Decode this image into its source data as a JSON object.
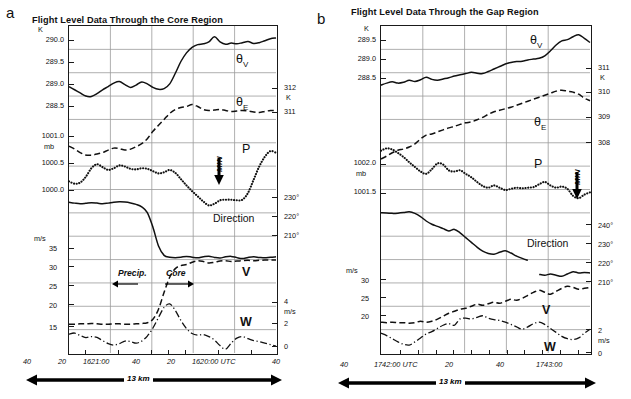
{
  "figure": {
    "panels": [
      {
        "letter": "a",
        "title": "Flight Level Data Through the Core Region",
        "left_axis": {
          "groups": [
            {
              "unit": "K",
              "labels": [
                "290.0",
                "289.5",
                "289.0",
                "288.5"
              ]
            },
            {
              "unit": "mb",
              "labels": [
                "1001.0",
                "1000.5",
                "1000.0"
              ]
            },
            {
              "unit": "m/s",
              "labels": [
                "35",
                "30",
                "25",
                "20",
                "15"
              ]
            }
          ]
        },
        "right_axis": {
          "groups": [
            {
              "unit": "K",
              "labels": [
                "312",
                "311"
              ]
            },
            {
              "unit": "",
              "labels": [
                "230°",
                "220°",
                "210°"
              ]
            },
            {
              "unit": "m/s",
              "labels": [
                "4",
                "2",
                "0"
              ]
            }
          ]
        },
        "x_ticks": [
          "40",
          "20",
          "1621:00",
          "40",
          "20",
          "1620:00 UTC",
          "40"
        ],
        "curve_labels": [
          {
            "name": "theta-v",
            "text": "θ",
            "sub": "V"
          },
          {
            "name": "theta-e",
            "text": "θ",
            "sub": "E"
          },
          {
            "name": "pressure",
            "text": "P",
            "sub": ""
          },
          {
            "name": "direction",
            "text": "Direction",
            "sub": ""
          },
          {
            "name": "wind-speed",
            "text": "V",
            "sub": ""
          },
          {
            "name": "vertical-velocity",
            "text": "W",
            "sub": ""
          }
        ],
        "annotations": [
          {
            "name": "min-marker",
            "text": "MIN"
          },
          {
            "name": "precip-label",
            "text": "Precip."
          },
          {
            "name": "core-label",
            "text": "Core"
          }
        ],
        "scale_bar": "13 km"
      },
      {
        "letter": "b",
        "title": "Flight Level Data Through the Gap Region",
        "left_axis": {
          "groups": [
            {
              "unit": "K",
              "labels": [
                "289.5",
                "289.0",
                "288.5"
              ]
            },
            {
              "unit": "mb",
              "labels": [
                "1002.0",
                "1001.5"
              ]
            },
            {
              "unit": "m/s",
              "labels": [
                "30",
                "25",
                "20"
              ]
            }
          ]
        },
        "right_axis": {
          "groups": [
            {
              "unit": "K",
              "labels": [
                "311",
                "310",
                "309",
                "308"
              ]
            },
            {
              "unit": "",
              "labels": [
                "240°",
                "230°",
                "220°",
                "210°"
              ]
            },
            {
              "unit": "m/s",
              "labels": [
                "2",
                "0"
              ]
            }
          ]
        },
        "x_ticks": [
          "40",
          "1742:00 UTC",
          "20",
          "40",
          "1743:00"
        ],
        "curve_labels": [
          {
            "name": "theta-v",
            "text": "θ",
            "sub": "V"
          },
          {
            "name": "theta-e",
            "text": "θ",
            "sub": "E"
          },
          {
            "name": "pressure",
            "text": "P",
            "sub": ""
          },
          {
            "name": "direction",
            "text": "Direction",
            "sub": ""
          },
          {
            "name": "wind-speed",
            "text": "V",
            "sub": ""
          },
          {
            "name": "vertical-velocity",
            "text": "W",
            "sub": ""
          }
        ],
        "annotations": [
          {
            "name": "min-marker",
            "text": "MIN"
          }
        ],
        "scale_bar": "13 km"
      }
    ]
  },
  "chart_data": [
    {
      "type": "line",
      "title": "Flight Level Data Through the Core Region",
      "panel": "a",
      "xlabel": "Time (UTC, decreasing to the right)",
      "grid": true,
      "legend": "inline-curve-labels",
      "x_tick_labels": [
        "40",
        "20",
        "1621:00",
        "40",
        "20",
        "1620:00 UTC",
        "40"
      ],
      "axes": [
        {
          "name": "theta_v",
          "side": "left",
          "unit": "K",
          "ticks": [
            290.0,
            289.5,
            289.0,
            288.5
          ]
        },
        {
          "name": "theta_e",
          "side": "right",
          "unit": "K",
          "ticks": [
            312,
            311
          ]
        },
        {
          "name": "P",
          "side": "left",
          "unit": "mb",
          "ticks": [
            1001.0,
            1000.5,
            1000.0
          ]
        },
        {
          "name": "Direction",
          "side": "right",
          "unit": "deg",
          "ticks": [
            230,
            220,
            210
          ]
        },
        {
          "name": "V",
          "side": "left",
          "unit": "m/s",
          "ticks": [
            35,
            30,
            25,
            20,
            15
          ]
        },
        {
          "name": "W",
          "side": "right",
          "unit": "m/s",
          "ticks": [
            4,
            2,
            0
          ]
        }
      ],
      "series": [
        {
          "name": "θv",
          "unit": "K",
          "style": "solid",
          "values": [
            288.88,
            288.8,
            288.72,
            288.64,
            288.63,
            288.7,
            288.8,
            288.88,
            288.97,
            289.01,
            288.93,
            288.86,
            288.92,
            289.0,
            288.95,
            288.86,
            288.81,
            288.83,
            288.95,
            289.22,
            289.52,
            289.74,
            289.88,
            289.95,
            289.97,
            290.02,
            290.15,
            290.02,
            289.96,
            289.99,
            289.97,
            290.0,
            290.03,
            289.98,
            290.0,
            290.05,
            290.1,
            290.12
          ]
        },
        {
          "name": "θE",
          "unit": "K",
          "style": "dashed",
          "values": [
            311.18,
            311.12,
            311.05,
            311.0,
            311.0,
            311.02,
            311.05,
            311.1,
            311.14,
            311.13,
            311.1,
            311.12,
            311.17,
            311.23,
            311.33,
            311.48,
            311.6,
            311.72,
            311.84,
            311.92,
            311.96,
            311.98,
            312.02,
            311.98,
            311.92,
            311.9,
            311.91,
            311.92,
            311.9,
            311.88,
            311.89,
            311.9,
            311.89,
            311.87,
            311.86,
            311.88,
            311.9,
            311.9
          ]
        },
        {
          "name": "P",
          "unit": "mb",
          "style": "dotted",
          "values": [
            1000.32,
            1000.28,
            1000.3,
            1000.4,
            1000.55,
            1000.62,
            1000.57,
            1000.52,
            1000.55,
            1000.6,
            1000.58,
            1000.54,
            1000.53,
            1000.55,
            1000.54,
            1000.5,
            1000.46,
            1000.48,
            1000.52,
            1000.47,
            1000.36,
            1000.25,
            1000.15,
            1000.06,
            999.97,
            999.9,
            999.93,
            999.99,
            1000.0,
            1000.0,
            999.99,
            1000.0,
            1000.12,
            1000.35,
            1000.58,
            1000.75,
            1000.85,
            1000.82
          ]
        },
        {
          "name": "Direction",
          "unit": "deg",
          "style": "solid",
          "values": [
            236.0,
            235.6,
            235.3,
            235.5,
            235.8,
            235.6,
            235.3,
            235.6,
            236.0,
            236.2,
            236.1,
            235.7,
            235.0,
            233.8,
            231.0,
            224.0,
            215.0,
            210.5,
            209.6,
            209.4,
            209.6,
            210.0,
            209.6,
            209.3,
            209.8,
            210.1,
            209.5,
            209.2,
            209.8,
            210.0,
            209.4,
            209.0,
            209.5,
            209.8,
            209.5,
            209.3,
            209.6,
            209.8
          ]
        },
        {
          "name": "V",
          "unit": "m/s",
          "style": "dashed",
          "values": [
            15.0,
            15.0,
            15.1,
            15.1,
            15.2,
            15.1,
            15.0,
            15.0,
            15.1,
            15.1,
            15.0,
            15.0,
            15.1,
            15.2,
            15.4,
            16.3,
            19.0,
            23.5,
            27.5,
            29.8,
            30.6,
            30.9,
            31.5,
            31.9,
            31.7,
            31.3,
            31.5,
            31.8,
            31.9,
            31.7,
            31.8,
            31.9,
            32.0,
            31.9,
            32.0,
            32.1,
            32.1,
            32.1
          ]
        },
        {
          "name": "W",
          "unit": "m/s",
          "style": "dashdot",
          "values": [
            0.95,
            1.05,
            0.8,
            0.6,
            0.7,
            0.62,
            0.3,
            0.0,
            -0.15,
            0.0,
            0.25,
            0.2,
            0.05,
            0.25,
            0.75,
            1.55,
            2.6,
            3.6,
            3.95,
            3.3,
            2.3,
            1.5,
            1.0,
            0.85,
            0.9,
            0.7,
            0.35,
            -0.2,
            -0.55,
            0.05,
            0.55,
            0.7,
            0.5,
            0.3,
            0.2,
            0.05,
            -0.1,
            -0.25
          ]
        }
      ]
    },
    {
      "type": "line",
      "title": "Flight Level Data Through the Gap Region",
      "panel": "b",
      "xlabel": "Time (UTC, decreasing to the right)",
      "grid": true,
      "legend": "inline-curve-labels",
      "x_tick_labels": [
        "40",
        "1742:00 UTC",
        "20",
        "40",
        "1743:00"
      ],
      "axes": [
        {
          "name": "theta_v",
          "side": "left",
          "unit": "K",
          "ticks": [
            289.5,
            289.0,
            288.5
          ]
        },
        {
          "name": "theta_e",
          "side": "right",
          "unit": "K",
          "ticks": [
            311,
            310,
            309,
            308
          ]
        },
        {
          "name": "P",
          "side": "left",
          "unit": "mb",
          "ticks": [
            1002.0,
            1001.5
          ]
        },
        {
          "name": "Direction",
          "side": "right",
          "unit": "deg",
          "ticks": [
            240,
            230,
            220,
            210
          ]
        },
        {
          "name": "V",
          "side": "left",
          "unit": "m/s",
          "ticks": [
            30,
            25,
            20
          ]
        },
        {
          "name": "W",
          "side": "right",
          "unit": "m/s",
          "ticks": [
            2,
            0
          ]
        }
      ],
      "series": [
        {
          "name": "θv",
          "unit": "K",
          "style": "solid",
          "values": [
            288.45,
            288.5,
            288.53,
            288.5,
            288.52,
            288.57,
            288.54,
            288.58,
            288.64,
            288.59,
            288.57,
            288.6,
            288.63,
            288.67,
            288.7,
            288.73,
            288.76,
            288.74,
            288.73,
            288.78,
            288.84,
            288.9,
            288.96,
            289.0,
            289.02,
            289.03,
            289.06,
            289.08,
            289.1,
            289.16,
            289.28,
            289.42,
            289.52,
            289.55,
            289.62,
            289.67,
            289.58,
            289.48
          ]
        },
        {
          "name": "θE",
          "unit": "K",
          "style": "dashed",
          "values": [
            307.6,
            307.72,
            307.85,
            307.95,
            308.0,
            308.08,
            308.2,
            308.4,
            308.55,
            308.6,
            308.68,
            308.76,
            308.84,
            308.9,
            308.98,
            309.04,
            309.08,
            309.16,
            309.26,
            309.38,
            309.48,
            309.54,
            309.6,
            309.66,
            309.74,
            309.82,
            309.9,
            309.98,
            310.06,
            310.14,
            310.22,
            310.3,
            310.34,
            310.3,
            310.26,
            310.18,
            310.02,
            309.92
          ]
        },
        {
          "name": "P",
          "unit": "mb",
          "style": "dotted",
          "values": [
            1002.16,
            1002.2,
            1002.18,
            1002.12,
            1002.05,
            1001.96,
            1001.88,
            1001.8,
            1001.76,
            1001.84,
            1001.94,
            1001.92,
            1001.82,
            1001.8,
            1001.82,
            1001.76,
            1001.7,
            1001.62,
            1001.55,
            1001.52,
            1001.56,
            1001.52,
            1001.48,
            1001.5,
            1001.52,
            1001.51,
            1001.52,
            1001.53,
            1001.58,
            1001.62,
            1001.56,
            1001.52,
            1001.54,
            1001.5,
            1001.38,
            1001.34,
            1001.4,
            1001.44
          ]
        },
        {
          "name": "Direction",
          "unit": "deg",
          "style": "solid",
          "values": [
            243.5,
            243.4,
            243.2,
            243.3,
            243.6,
            244.0,
            243.2,
            241.5,
            239.2,
            237.5,
            236.4,
            235.2,
            234.0,
            234.8,
            233.0,
            230.5,
            228.0,
            225.5,
            223.4,
            222.2,
            221.8,
            222.8,
            223.6,
            222.4,
            220.8,
            219.6,
            218.6,
            null,
            211.2,
            210.8,
            211.4,
            210.8,
            210.2,
            211.4,
            212.6,
            212.0,
            212.2,
            212.0
          ]
        },
        {
          "name": "V",
          "unit": "m/s",
          "style": "dashed",
          "values": [
            20.6,
            20.5,
            20.6,
            20.5,
            20.5,
            20.4,
            20.5,
            20.8,
            20.6,
            20.8,
            21.2,
            21.8,
            22.4,
            22.8,
            23.2,
            23.4,
            23.8,
            24.2,
            24.0,
            24.3,
            24.6,
            24.4,
            24.8,
            25.2,
            25.0,
            25.4,
            26.0,
            26.6,
            27.0,
            26.6,
            26.2,
            26.8,
            27.4,
            27.8,
            27.6,
            27.2,
            27.4,
            27.6
          ]
        },
        {
          "name": "W",
          "unit": "m/s",
          "style": "dashdot",
          "values": [
            0.45,
            0.3,
            0.1,
            -0.1,
            -0.25,
            -0.3,
            -0.1,
            0.15,
            0.4,
            0.55,
            0.75,
            0.95,
            1.05,
            0.95,
            1.35,
            1.4,
            1.35,
            1.45,
            1.55,
            1.4,
            1.3,
            1.25,
            1.15,
            1.0,
            0.85,
            0.7,
            0.85,
            1.05,
            1.15,
            1.0,
            0.75,
            0.5,
            0.25,
            0.1,
            0.05,
            0.15,
            0.45,
            0.7
          ]
        }
      ]
    }
  ]
}
